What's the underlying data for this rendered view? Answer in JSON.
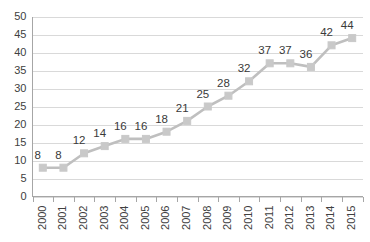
{
  "chart_data": {
    "type": "line",
    "title": "",
    "subtitle": "",
    "xlabel": "",
    "ylabel": "",
    "categories": [
      "2000",
      "2001",
      "2002",
      "2003",
      "2004",
      "2005",
      "2006",
      "2007",
      "2008",
      "2009",
      "2010",
      "2011",
      "2012",
      "2013",
      "2014",
      "2015"
    ],
    "values": [
      8,
      8,
      12,
      14,
      16,
      16,
      18,
      21,
      25,
      28,
      32,
      37,
      37,
      36,
      42,
      44
    ],
    "data_labels": [
      "8",
      "8",
      "12",
      "14",
      "16",
      "16",
      "18",
      "21",
      "25",
      "28",
      "32",
      "37",
      "37",
      "36",
      "42",
      "44"
    ],
    "ylim": [
      0,
      50
    ],
    "ytick_labels": [
      "0",
      "5",
      "10",
      "15",
      "20",
      "25",
      "30",
      "35",
      "40",
      "45",
      "50"
    ],
    "ytick_values": [
      0,
      5,
      10,
      15,
      20,
      25,
      30,
      35,
      40,
      45,
      50
    ],
    "grid": true,
    "grid_axis": "y",
    "legend": false,
    "legend_position": "none",
    "marker": "square",
    "xtick_rotation": -90,
    "colors": {
      "series_line": "#bfbfbf",
      "series_marker": "#c9c9c9",
      "gridline": "#d9d9d9",
      "axis": "#a6a6a6",
      "tick_text": "#404040",
      "data_label_text": "#3a3a3a",
      "background": "#ffffff"
    }
  }
}
